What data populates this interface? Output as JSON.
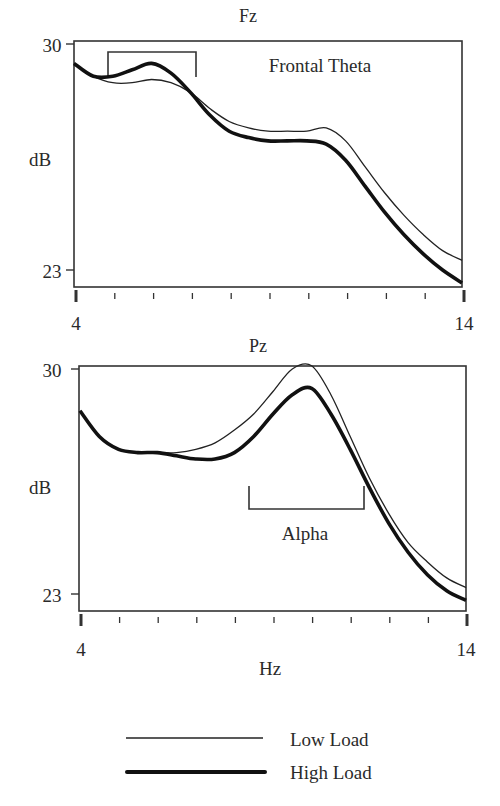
{
  "chart_data": [
    {
      "type": "line",
      "title": "Fz",
      "annotation": "Frontal Theta",
      "xlabel": "",
      "ylabel": "dB",
      "xlim": [
        4,
        14
      ],
      "ylim": [
        23,
        30
      ],
      "x_tick_labels": [
        "4",
        "14"
      ],
      "y_tick_labels": [
        "30",
        "23"
      ],
      "x_minor_ticks": [
        5,
        6,
        7,
        8,
        9,
        10,
        11,
        12,
        13
      ],
      "grid": false,
      "bracket": {
        "label": "Frontal Theta",
        "x_start": 4.9,
        "x_end": 7.2
      },
      "x": [
        4,
        4.5,
        5,
        5.5,
        6,
        6.5,
        7,
        7.5,
        8,
        8.5,
        9,
        9.5,
        10,
        10.5,
        11,
        11.5,
        12,
        12.5,
        13,
        13.5,
        14
      ],
      "series": [
        {
          "name": "Low Load",
          "values": [
            29.4,
            29.0,
            28.8,
            28.8,
            28.9,
            28.8,
            28.5,
            28.0,
            27.6,
            27.4,
            27.3,
            27.3,
            27.3,
            27.4,
            27.0,
            26.2,
            25.4,
            24.7,
            24.1,
            23.6,
            23.3
          ]
        },
        {
          "name": "High Load",
          "values": [
            29.4,
            29.0,
            29.0,
            29.2,
            29.4,
            29.1,
            28.5,
            27.8,
            27.3,
            27.1,
            27.0,
            27.0,
            27.0,
            26.9,
            26.4,
            25.6,
            24.8,
            24.1,
            23.5,
            23.0,
            22.6
          ]
        }
      ]
    },
    {
      "type": "line",
      "title": "Pz",
      "annotation": "Alpha",
      "xlabel": "Hz",
      "ylabel": "dB",
      "xlim": [
        4,
        14
      ],
      "ylim": [
        23,
        30
      ],
      "x_tick_labels": [
        "4",
        "14"
      ],
      "y_tick_labels": [
        "30",
        "23"
      ],
      "x_minor_ticks": [
        5,
        6,
        7,
        8,
        9,
        10,
        11,
        12,
        13
      ],
      "grid": false,
      "bracket": {
        "label": "Alpha",
        "x_start": 8.4,
        "x_end": 11.4
      },
      "x": [
        4,
        4.5,
        5,
        5.5,
        6,
        6.5,
        7,
        7.5,
        8,
        8.5,
        9,
        9.5,
        10,
        10.5,
        11,
        11.5,
        12,
        12.5,
        13,
        13.5,
        14
      ],
      "series": [
        {
          "name": "Low Load",
          "values": [
            28.7,
            27.9,
            27.5,
            27.4,
            27.4,
            27.4,
            27.5,
            27.7,
            28.1,
            28.6,
            29.3,
            30.0,
            30.1,
            29.2,
            27.9,
            26.6,
            25.5,
            24.6,
            24.0,
            23.5,
            23.2
          ]
        },
        {
          "name": "High Load",
          "values": [
            28.7,
            27.9,
            27.5,
            27.4,
            27.4,
            27.3,
            27.2,
            27.2,
            27.4,
            27.9,
            28.6,
            29.2,
            29.4,
            28.6,
            27.5,
            26.3,
            25.2,
            24.3,
            23.6,
            23.1,
            22.8
          ]
        }
      ]
    }
  ],
  "legend": {
    "items": [
      {
        "label": "Low Load",
        "style": "thin"
      },
      {
        "label": "High Load",
        "style": "thick"
      }
    ]
  },
  "colors": {
    "line": "#111111",
    "axis": "#333333",
    "text": "#2a2a2a"
  }
}
